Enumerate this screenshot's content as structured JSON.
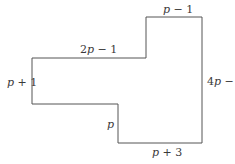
{
  "diagram": {
    "type": "rectilinear-polygon",
    "stroke_color": "#555555",
    "vertices": [
      [
        32,
        58
      ],
      [
        146,
        58
      ],
      [
        146,
        17
      ],
      [
        202,
        17
      ],
      [
        202,
        143
      ],
      [
        118,
        143
      ],
      [
        118,
        104
      ],
      [
        32,
        104
      ]
    ],
    "labels": {
      "top_right": {
        "var": "p",
        "rest": " − 1",
        "side": "top of upper block"
      },
      "top_left": {
        "coef": "2",
        "var": "p",
        "rest": " − 1",
        "side": "top of left block"
      },
      "left": {
        "var": "p",
        "rest": " + 1",
        "side": "left side"
      },
      "right": {
        "coef": "4",
        "var": "p",
        "rest": " − 2",
        "side": "right side"
      },
      "inner": {
        "var": "p",
        "rest": "",
        "side": "inner vertical step"
      },
      "bottom": {
        "var": "p",
        "rest": " + 3",
        "side": "bottom"
      }
    }
  }
}
